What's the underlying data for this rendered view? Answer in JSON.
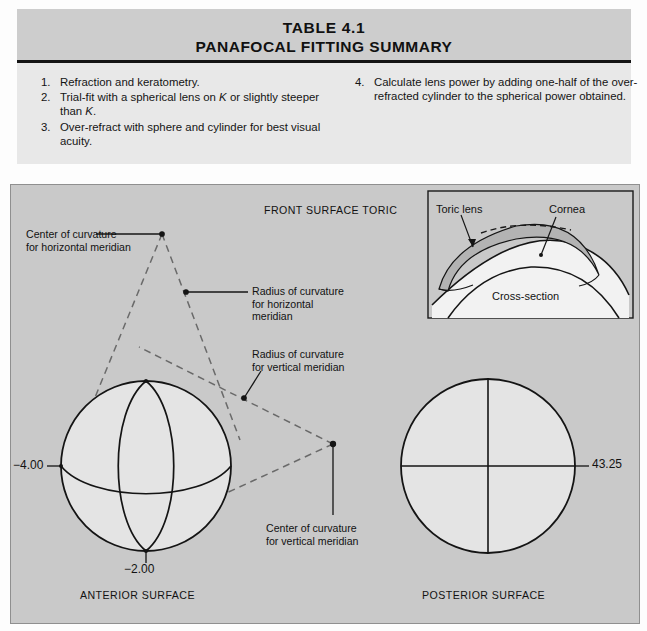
{
  "table": {
    "title": "TABLE 4.1",
    "subtitle": "PANAFOCAL FITTING SUMMARY",
    "left_items": [
      {
        "num": "1.",
        "text": "Refraction and keratometry."
      },
      {
        "num": "2.",
        "text": "Trial-fit with a spherical lens on K or slightly steeper than K."
      },
      {
        "num": "3.",
        "text": "Over-refract with sphere and cylinder for best visual acuity."
      }
    ],
    "right_items": [
      {
        "num": "4.",
        "text": "Calculate lens power by adding one-half of the over-refracted cylinder to the spherical power obtained."
      }
    ]
  },
  "figure": {
    "heading": "FRONT SURFACE TORIC",
    "labels": {
      "center_horizontal": "Center of curvature\nfor horizontal meridian",
      "radius_horizontal": "Radius of curvature\nfor horizontal\nmeridian",
      "radius_vertical": "Radius of curvature\nfor vertical meridian",
      "center_vertical": "Center of curvature\nfor vertical meridian",
      "anterior_caption": "ANTERIOR SURFACE",
      "posterior_caption": "POSTERIOR SURFACE"
    },
    "values": {
      "anterior_horizontal_power": "−4.00",
      "anterior_vertical_power": "−2.00",
      "posterior_power": "43.25"
    },
    "inset": {
      "lens_label": "Toric lens",
      "cornea_label": "Cornea",
      "caption": "Cross-section"
    }
  },
  "colors": {
    "panel_bg": "#c9c9c9",
    "table_header_bg": "#cdcdcd",
    "table_body_bg": "#e8e8e8",
    "ink": "#141414",
    "sphere_fill": "#e4e4e4",
    "lens_fill": "#b3b3b3"
  }
}
